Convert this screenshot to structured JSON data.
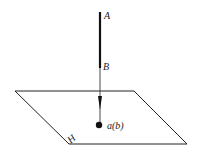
{
  "diagram": {
    "labels": {
      "point_a_upper": "A",
      "point_b": "B",
      "projection": "a(b)",
      "plane": "H"
    },
    "colors": {
      "line": "#111111",
      "background": "#ffffff"
    }
  }
}
